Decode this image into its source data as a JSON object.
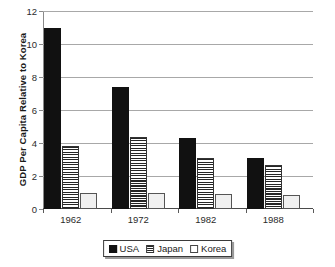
{
  "chart_data": {
    "type": "bar",
    "title": "",
    "subtitle": "",
    "xlabel": "",
    "ylabel": "GDP Per Capita Relative to Korea",
    "categories": [
      "1962",
      "1972",
      "1982",
      "1988"
    ],
    "series": [
      {
        "name": "USA",
        "values": [
          11.0,
          7.4,
          4.3,
          3.1
        ]
      },
      {
        "name": "Japan",
        "values": [
          3.8,
          4.35,
          3.1,
          2.65
        ]
      },
      {
        "name": "Korea",
        "values": [
          1.0,
          0.95,
          0.9,
          0.85
        ]
      }
    ],
    "ylim": [
      0,
      12
    ],
    "yticks": [
      0,
      2,
      4,
      6,
      8,
      10,
      12
    ],
    "ytick_labels": [
      "0",
      "2",
      "4",
      "6",
      "8",
      "10",
      "12"
    ],
    "grid": true,
    "grid_axis": "y",
    "legend_position": "bottom",
    "colors": {
      "usa": "#111111",
      "japan": "#262626",
      "korea": "#f0f0f0",
      "gridline": "#a8a8a8",
      "axis": "#4a4a4a",
      "text": "#1a1a1a"
    }
  },
  "legend": {
    "items": [
      {
        "label": "USA",
        "swatch": "solid-black-swatch"
      },
      {
        "label": "Japan",
        "swatch": "horizontal-stripe-swatch"
      },
      {
        "label": "Korea",
        "swatch": "white-swatch"
      }
    ]
  }
}
